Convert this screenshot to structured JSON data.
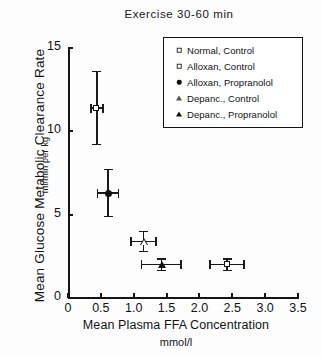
{
  "chart_data": {
    "type": "scatter",
    "title": "Exercise 30-60 min",
    "xlabel": "Mean Plasma FFA Concentration",
    "xunits": "mmol/l",
    "ylabel": "Mean Glucose Metabolic Clearance Rate",
    "yunits": "ml/min per kg",
    "xlim": [
      0,
      3.5
    ],
    "ylim": [
      0,
      15
    ],
    "xticks": [
      "0",
      "0.5",
      "1.0",
      "1.5",
      "2.0",
      "2.5",
      "3.0",
      "3.5"
    ],
    "xtick_values": [
      0,
      0.5,
      1.0,
      1.5,
      2.0,
      2.5,
      3.0,
      3.5
    ],
    "yticks": [
      "0",
      "5",
      "10",
      "15"
    ],
    "ytick_values": [
      0,
      5,
      10,
      15
    ],
    "grid": false,
    "legend_position": "top-right",
    "legend": [
      {
        "label": "Normal, Control",
        "marker": "square-open"
      },
      {
        "label": "Alloxan, Control",
        "marker": "square-open"
      },
      {
        "label": "Alloxan, Propranolol",
        "marker": "circle-filled"
      },
      {
        "label": "Depanc., Control",
        "marker": "triangle-open"
      },
      {
        "label": "Depanc., Propranolol",
        "marker": "triangle-filled"
      }
    ],
    "points": [
      {
        "name": "Normal, Control",
        "marker": "square-open",
        "x": 0.44,
        "y": 11.4,
        "xerr": 0.09,
        "yerr": 2.2
      },
      {
        "name": "Alloxan, Propranolol",
        "marker": "circle-filled",
        "x": 0.61,
        "y": 6.3,
        "xerr": 0.16,
        "yerr": 1.4
      },
      {
        "name": "Depanc., Control",
        "marker": "triangle-open",
        "x": 1.15,
        "y": 3.4,
        "xerr": 0.19,
        "yerr": 0.6
      },
      {
        "name": "Depanc., Propranolol",
        "marker": "triangle-filled",
        "x": 1.42,
        "y": 2.0,
        "xerr": 0.3,
        "yerr": 0.35
      },
      {
        "name": "Alloxan, Control",
        "marker": "square-open",
        "x": 2.42,
        "y": 2.0,
        "xerr": 0.26,
        "yerr": 0.35
      }
    ]
  },
  "colors": {
    "ink": "#141414",
    "background": "#ffffff"
  }
}
